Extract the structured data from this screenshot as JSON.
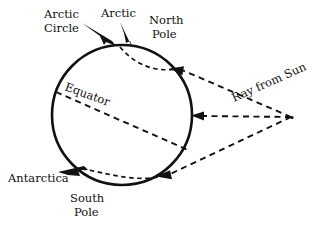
{
  "diagram": {
    "background_color": "#ffffff",
    "ink_color": "#111111",
    "labels": {
      "arctic_circle_line1": "Arctic",
      "arctic_circle_line2": "Circle",
      "arctic": "Arctic",
      "north_pole_line1": "North",
      "north_pole_line2": "Pole",
      "equator": "Equator",
      "ray_from_sun": "Ray from Sun",
      "antarctica": "Antarctica",
      "south_pole_line1": "South",
      "south_pole_line2": "Pole"
    },
    "geometry": {
      "earth_center_x": 122,
      "earth_center_y": 115,
      "earth_radius": 70,
      "sun_point_x": 293,
      "sun_point_y": 118,
      "equator_tilt_degrees": 23.5,
      "ray_count": 3
    }
  }
}
